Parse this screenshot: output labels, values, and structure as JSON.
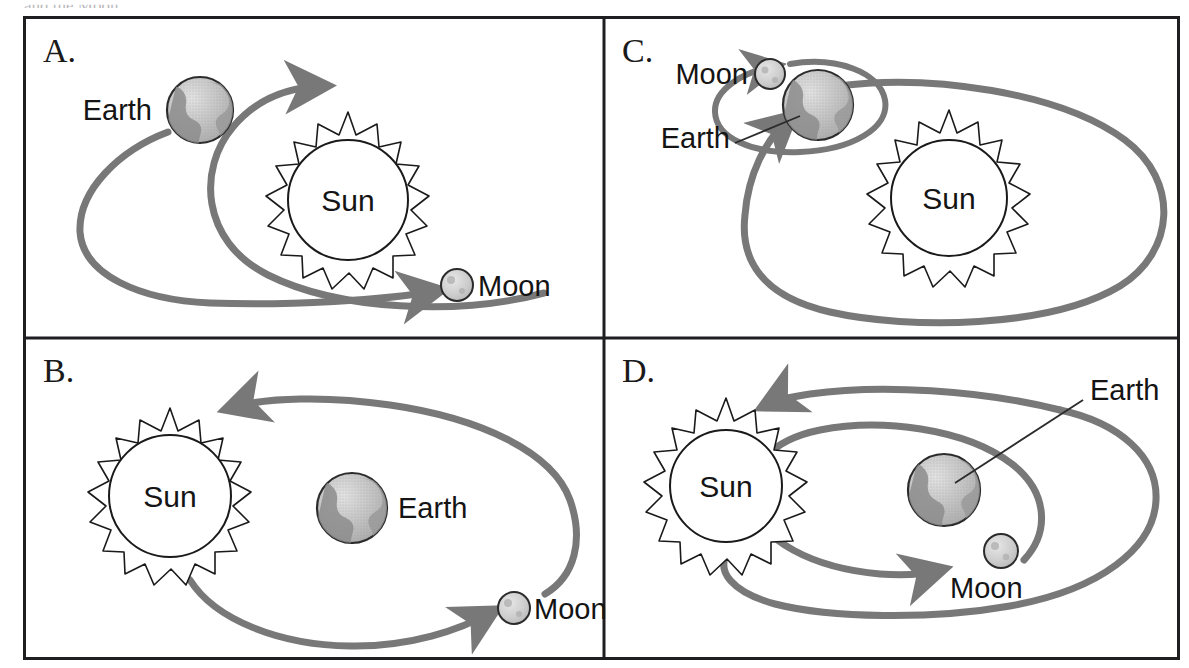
{
  "figure": {
    "type": "multiple-choice-diagram",
    "topic": "Models of the Sun, Earth and Moon system",
    "cutoff_caption": "and the Moon.",
    "panel_count": 4,
    "grid": {
      "columns": 2,
      "rows": 2
    },
    "colors": {
      "border": "#1f1f22",
      "orbit_arc": "#787878",
      "sun_outline": "#1a1a1a",
      "earth_fill": "#bdbdbd",
      "moon_fill": "#c9c9c9",
      "label_text": "#141414",
      "background": "#ffffff"
    }
  },
  "panels": [
    {
      "id": "A",
      "letter": "A.",
      "position": "top-left",
      "labels": {
        "sun": "Sun",
        "earth": "Earth",
        "moon": "Moon"
      },
      "description": "Sun at center; a single orbit path with Earth at upper left and Moon at lower right, both on the same orbit around the Sun."
    },
    {
      "id": "B",
      "letter": "B.",
      "position": "bottom-left",
      "labels": {
        "sun": "Sun",
        "earth": "Earth",
        "moon": "Moon"
      },
      "description": "Sun at left with Earth free-standing at center; one orbit arc sweeps from the Sun to the Moon at lower right."
    },
    {
      "id": "C",
      "letter": "C.",
      "position": "top-right",
      "labels": {
        "sun": "Sun",
        "earth": "Earth",
        "moon": "Moon"
      },
      "description": "Sun at center-right inside a large orbit; Earth sits on that orbit at upper left with the Moon circling Earth on a small ellipse."
    },
    {
      "id": "D",
      "letter": "D.",
      "position": "bottom-right",
      "labels": {
        "sun": "Sun",
        "earth": "Earth",
        "moon": "Moon"
      },
      "description": "Sun at left; a large outer orbit and a smaller inner orbit; Earth at center of the inner orbit with the Moon travelling on it."
    }
  ],
  "icons": {
    "sun": "sun-icon",
    "earth": "earth-globe-icon",
    "moon": "moon-icon",
    "orbit_arrow": "orbit-arrow-icon",
    "leader_line": "leader-line-icon"
  }
}
